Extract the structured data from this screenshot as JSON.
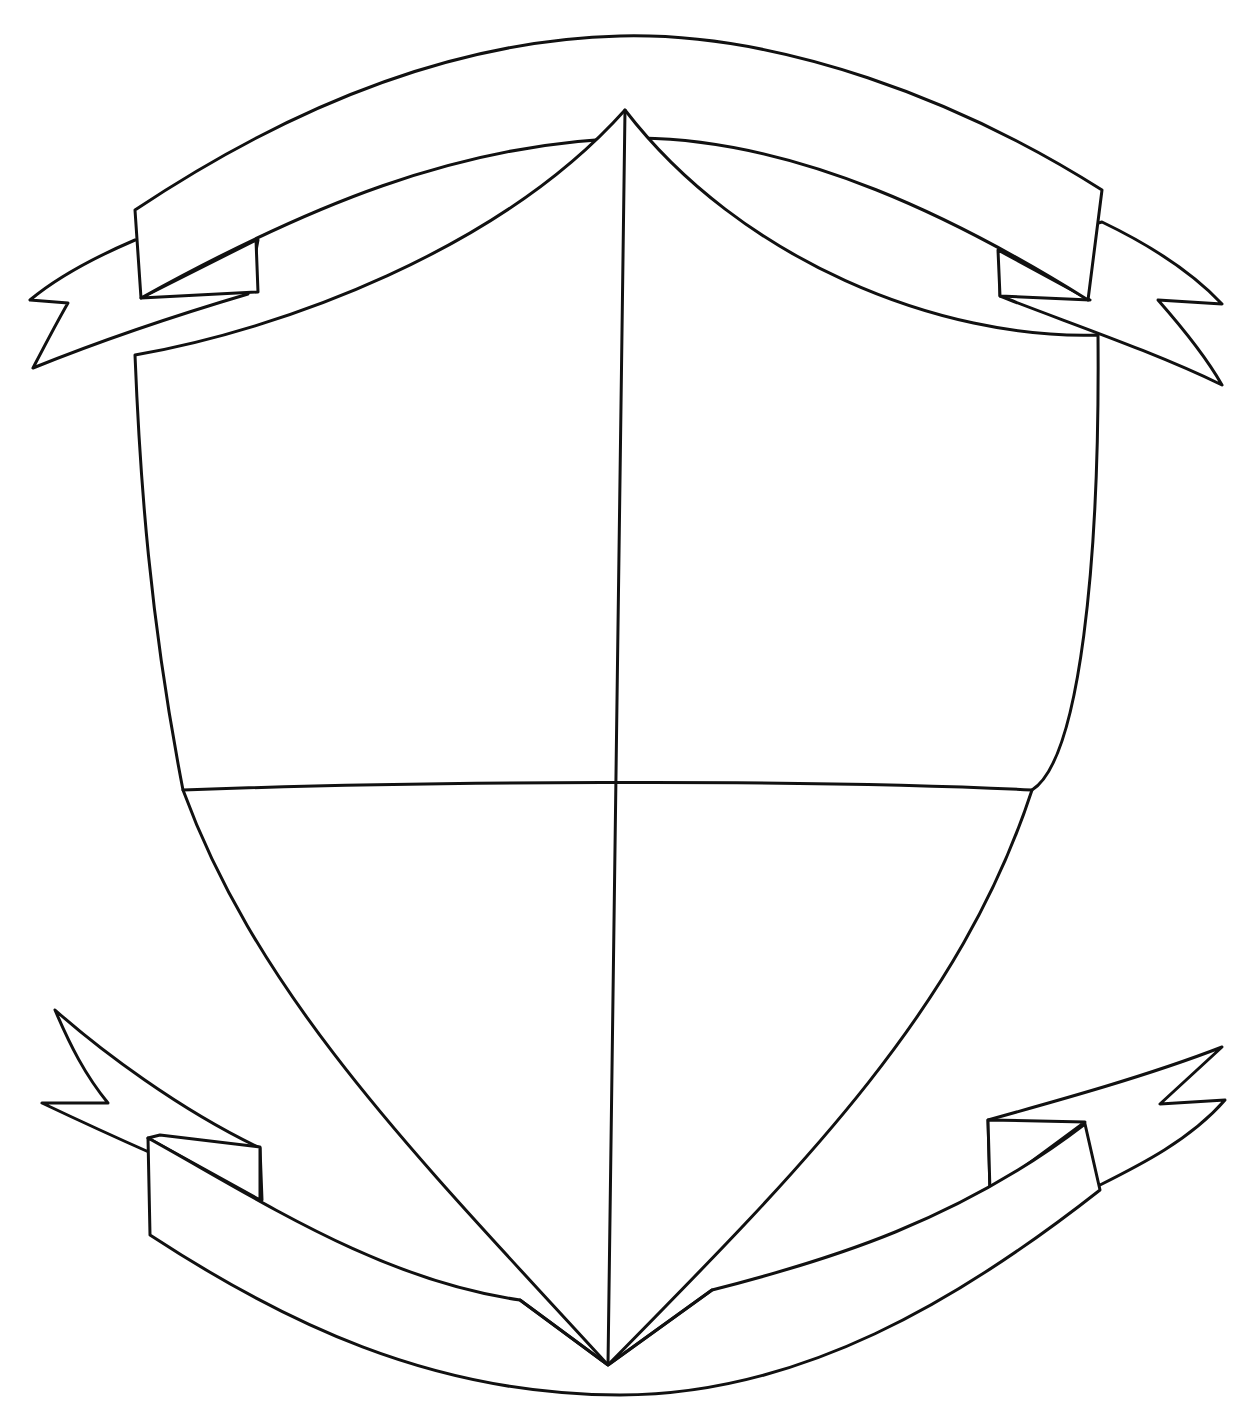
{
  "drawing": {
    "subject": "shield-with-banners-coloring-outline",
    "stroke_color": "#111111",
    "background_color": "#ffffff",
    "shield": {
      "quarters": 4
    },
    "banners": {
      "top": 1,
      "bottom": 1
    }
  }
}
